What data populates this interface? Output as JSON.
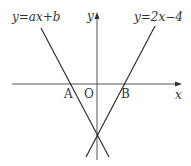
{
  "diagram": {
    "lines": [
      {
        "label": "y=ax+b",
        "name": "line-ax-b"
      },
      {
        "label": "y=2x−4",
        "name": "line-2x-4"
      }
    ],
    "axes": {
      "x_label": "x",
      "y_label": "y"
    },
    "points": {
      "A": "A",
      "O": "O",
      "B": "B"
    },
    "colors": {
      "stroke": "#333333",
      "background": "#ffffff"
    }
  }
}
